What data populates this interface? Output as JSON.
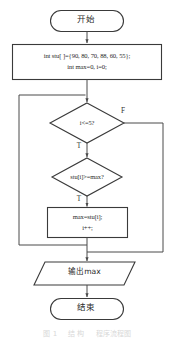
{
  "diagram": {
    "title_caption": "图 1     结 构     程序流程图",
    "type": "flowchart",
    "orientation": "top-to-bottom",
    "colors": {
      "shape_stroke": "#3a3a3a",
      "shape_fill": "#ffffff",
      "connector": "#4a4a4a",
      "text": "#2b2b2b",
      "caption_text": "#d8d8d8",
      "background": "#ffffff"
    },
    "nodes": {
      "start": {
        "shape": "terminator",
        "label": "开始"
      },
      "init": {
        "shape": "process",
        "line1": "int stu[ ]={90, 80, 70, 88, 60, 55};",
        "line2": "int max=0, i=0;"
      },
      "loop_condition": {
        "shape": "decision",
        "label": "i<=5?"
      },
      "compare_condition": {
        "shape": "decision",
        "label": "stu[i]>=max?"
      },
      "update": {
        "shape": "process",
        "line1": "max=stu[i];",
        "line2": "i++;"
      },
      "output": {
        "shape": "input-output",
        "label": "输出max"
      },
      "end": {
        "shape": "terminator",
        "label": "结束"
      }
    },
    "branch_labels": {
      "loop_false": "F",
      "loop_true": "T",
      "compare_true": "T"
    }
  }
}
